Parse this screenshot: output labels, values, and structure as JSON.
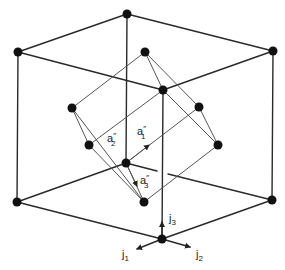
{
  "diagram": {
    "labels": {
      "a1": {
        "base": "a",
        "prime": "″",
        "sub": "1"
      },
      "a2": {
        "base": "a",
        "prime": "″",
        "sub": "2"
      },
      "a3": {
        "base": "a",
        "prime": "″",
        "sub": "3"
      },
      "j1": {
        "base": "j",
        "sub": "1"
      },
      "j2": {
        "base": "j",
        "sub": "2"
      },
      "j3": {
        "base": "j",
        "sub": "3"
      }
    },
    "colors": {
      "line": "#2a2a2a",
      "inner_line": "#555555",
      "atom": "#111111",
      "background": "#ffffff"
    }
  }
}
